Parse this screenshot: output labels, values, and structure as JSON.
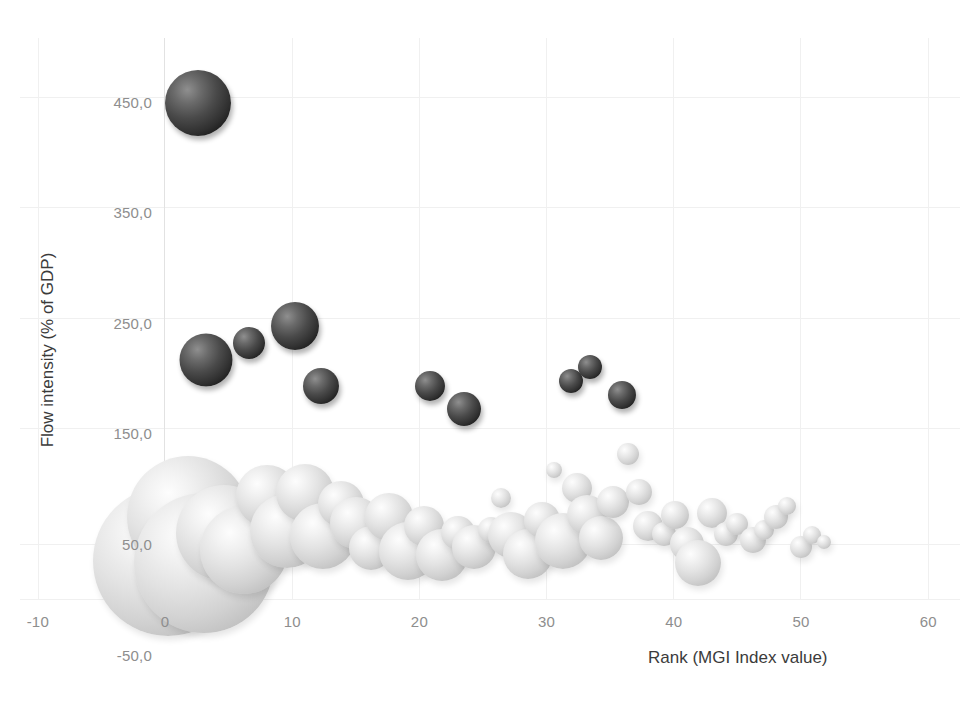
{
  "chart_data": {
    "type": "scatter",
    "subtype": "bubble",
    "title": "",
    "xlabel": "Rank (MGI Index value)",
    "ylabel": "Flow intensity (% of GDP)",
    "xlim": [
      -10,
      60
    ],
    "ylim": [
      -50,
      500
    ],
    "xticks": [
      -10,
      0,
      10,
      20,
      30,
      40,
      50,
      60
    ],
    "xtick_labels": [
      "-10",
      "0",
      "10",
      "20",
      "30",
      "40",
      "50",
      "60"
    ],
    "yticks": [
      -50,
      50,
      150,
      250,
      350,
      450
    ],
    "ytick_labels": [
      "-50,0",
      "50,0",
      "150,0",
      "250,0",
      "350,0",
      "450,0"
    ],
    "grid": true,
    "legend": "none",
    "series": [
      {
        "name": "high-intensity",
        "color": "#2b2b2b",
        "points": [
          {
            "x": 2.6,
            "y": 449,
            "size": 66
          },
          {
            "x": 3.2,
            "y": 216,
            "size": 53
          },
          {
            "x": 6.6,
            "y": 232,
            "size": 32
          },
          {
            "x": 10.2,
            "y": 247,
            "size": 48
          },
          {
            "x": 12.3,
            "y": 193,
            "size": 36
          },
          {
            "x": 20.8,
            "y": 193,
            "size": 30
          },
          {
            "x": 23.5,
            "y": 172,
            "size": 34
          },
          {
            "x": 31.9,
            "y": 197,
            "size": 24
          },
          {
            "x": 33.4,
            "y": 210,
            "size": 24
          },
          {
            "x": 35.9,
            "y": 185,
            "size": 28
          }
        ]
      },
      {
        "name": "standard-intensity",
        "color": "#dcdcdc",
        "points": [
          {
            "x": 0.2,
            "y": 35,
            "size": 150
          },
          {
            "x": 1.8,
            "y": 74,
            "size": 122
          },
          {
            "x": 3.1,
            "y": 33,
            "size": 140
          },
          {
            "x": 4.6,
            "y": 60,
            "size": 96
          },
          {
            "x": 6.2,
            "y": 45,
            "size": 88
          },
          {
            "x": 8.0,
            "y": 93,
            "size": 62
          },
          {
            "x": 9.6,
            "y": 62,
            "size": 74
          },
          {
            "x": 11.0,
            "y": 96,
            "size": 58
          },
          {
            "x": 12.4,
            "y": 57,
            "size": 66
          },
          {
            "x": 13.8,
            "y": 86,
            "size": 46
          },
          {
            "x": 15.0,
            "y": 69,
            "size": 52
          },
          {
            "x": 16.2,
            "y": 46,
            "size": 44
          },
          {
            "x": 17.6,
            "y": 74,
            "size": 48
          },
          {
            "x": 19.1,
            "y": 44,
            "size": 58
          },
          {
            "x": 20.4,
            "y": 66,
            "size": 40
          },
          {
            "x": 21.8,
            "y": 40,
            "size": 52
          },
          {
            "x": 23.0,
            "y": 60,
            "size": 34
          },
          {
            "x": 24.3,
            "y": 47,
            "size": 44
          },
          {
            "x": 25.6,
            "y": 63,
            "size": 26
          },
          {
            "x": 26.4,
            "y": 92,
            "size": 20
          },
          {
            "x": 27.2,
            "y": 58,
            "size": 46
          },
          {
            "x": 28.5,
            "y": 41,
            "size": 50
          },
          {
            "x": 29.6,
            "y": 72,
            "size": 36
          },
          {
            "x": 30.6,
            "y": 117,
            "size": 16
          },
          {
            "x": 31.3,
            "y": 53,
            "size": 56
          },
          {
            "x": 32.4,
            "y": 101,
            "size": 30
          },
          {
            "x": 33.2,
            "y": 76,
            "size": 40
          },
          {
            "x": 34.3,
            "y": 55,
            "size": 44
          },
          {
            "x": 35.2,
            "y": 88,
            "size": 32
          },
          {
            "x": 36.4,
            "y": 131,
            "size": 22
          },
          {
            "x": 37.3,
            "y": 97,
            "size": 26
          },
          {
            "x": 38.0,
            "y": 66,
            "size": 30
          },
          {
            "x": 39.2,
            "y": 59,
            "size": 24
          },
          {
            "x": 40.1,
            "y": 76,
            "size": 28
          },
          {
            "x": 41.0,
            "y": 50,
            "size": 34
          },
          {
            "x": 41.9,
            "y": 33,
            "size": 46
          },
          {
            "x": 43.0,
            "y": 78,
            "size": 30
          },
          {
            "x": 44.1,
            "y": 59,
            "size": 24
          },
          {
            "x": 45.0,
            "y": 68,
            "size": 22
          },
          {
            "x": 46.2,
            "y": 54,
            "size": 26
          },
          {
            "x": 47.1,
            "y": 63,
            "size": 20
          },
          {
            "x": 48.0,
            "y": 74,
            "size": 24
          },
          {
            "x": 48.9,
            "y": 84,
            "size": 18
          },
          {
            "x": 50.0,
            "y": 47,
            "size": 22
          },
          {
            "x": 50.9,
            "y": 58,
            "size": 18
          },
          {
            "x": 51.8,
            "y": 52,
            "size": 14
          }
        ]
      }
    ]
  }
}
